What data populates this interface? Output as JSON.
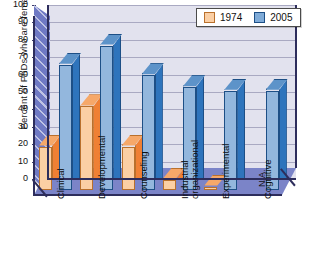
{
  "chart_data": {
    "type": "bar",
    "title": "",
    "xlabel": "",
    "ylabel": "Percent of PhDs who are female",
    "ylim": [
      0,
      100
    ],
    "ytick_step": 10,
    "yticks": [
      100,
      90,
      80,
      70,
      60,
      50,
      40,
      30,
      20,
      10,
      0
    ],
    "grid": true,
    "legend_position": "top-right",
    "categories": [
      "Clinical",
      "Developmental",
      "Counseling",
      "Industrial organizational",
      "Experimental",
      "Cognitive"
    ],
    "series": [
      {
        "name": "1974",
        "color": "#fbcfa4",
        "values": [
          25,
          48,
          25,
          6,
          2,
          null
        ]
      },
      {
        "name": "2005",
        "color": "#93b7dd",
        "values": [
          72,
          83,
          66,
          59,
          57,
          57
        ]
      }
    ],
    "annotations": [
      {
        "text": "N/A",
        "category": "Cognitive",
        "series": "1974"
      }
    ]
  },
  "legend": {
    "items": [
      {
        "label": "1974",
        "swatch": "legend-swatch-1974"
      },
      {
        "label": "2005",
        "swatch": "legend-swatch-2005"
      }
    ]
  },
  "axis": {
    "y_title": "Percent of PhDs who are female",
    "y_labels": [
      "100",
      "90",
      "80",
      "70",
      "60",
      "50",
      "40",
      "30",
      "20",
      "10",
      "0"
    ],
    "x_labels": [
      {
        "line1": "Clinical",
        "line2": ""
      },
      {
        "line1": "Developmental",
        "line2": ""
      },
      {
        "line1": "Counseling",
        "line2": ""
      },
      {
        "line1": "Industrial",
        "line2": "organizational"
      },
      {
        "line1": "Experimental",
        "line2": ""
      },
      {
        "line1": "Cognitive",
        "line2": ""
      }
    ]
  },
  "colors": {
    "bar_1974_front": "#fbcfa4",
    "bar_1974_side": "#ef8034",
    "bar_2005_front": "#93b7dd",
    "bar_2005_side": "#2e74bc",
    "plot_background": "#e2e2ee",
    "wall": "#6f79c4",
    "floor": "#7b84c8",
    "gridline": "#a9a9c2",
    "axis": "#2d2d5c"
  },
  "na_text": "N/A"
}
